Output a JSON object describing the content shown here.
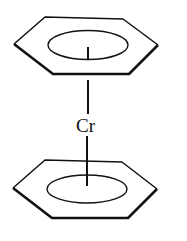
{
  "diagram": {
    "title": "",
    "metal_label": "Cr",
    "ligands": [
      {
        "name": "top-benzene-ring",
        "type": "hexagon"
      },
      {
        "name": "bottom-benzene-ring",
        "type": "hexagon"
      }
    ],
    "stroke_color": "#111111",
    "background": "#ffffff"
  }
}
